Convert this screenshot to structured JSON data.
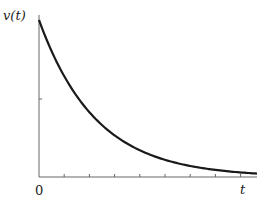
{
  "chart_data": {
    "type": "line",
    "title": "",
    "xlabel": "t",
    "ylabel": "v(t)",
    "x_tick_labels": [
      "0"
    ],
    "x_ticks": 8,
    "y_ticks": 1,
    "grid": false,
    "series": [
      {
        "name": "v(t)",
        "x": [
          0,
          1,
          2,
          3,
          4,
          5,
          6,
          7,
          8,
          8.7
        ],
        "values": [
          1.0,
          0.66,
          0.42,
          0.26,
          0.16,
          0.1,
          0.06,
          0.04,
          0.03,
          0.02
        ]
      }
    ],
    "ylim": [
      0,
      1.03
    ],
    "xlim": [
      0,
      8.7
    ],
    "annotation": "exponential decay curve"
  },
  "labels": {
    "y_axis": "v(t)",
    "x_axis": "t",
    "origin": "0"
  }
}
